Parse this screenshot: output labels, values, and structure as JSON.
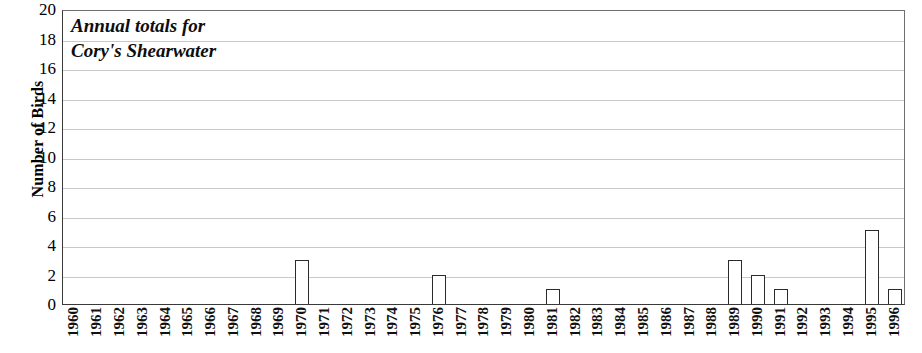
{
  "chart_data": {
    "type": "bar",
    "title": "Annual totals for Cory's Shearwater",
    "title_lines": [
      "Annual totals for",
      "Cory's Shearwater"
    ],
    "xlabel": "",
    "ylabel": "Number of Birds",
    "ylim": [
      0,
      20
    ],
    "ytick_step": 2,
    "yticks": [
      20,
      18,
      16,
      14,
      12,
      10,
      8,
      6,
      4,
      2,
      0
    ],
    "grid": true,
    "grid_axis": "y",
    "legend": null,
    "bar_color": "#ffffff",
    "bar_edge_color": "#2b2b2b",
    "grid_color": "#c9c9c9",
    "axis_color": "#3a3a3a",
    "categories": [
      "1960",
      "1961",
      "1962",
      "1963",
      "1964",
      "1965",
      "1966",
      "1967",
      "1968",
      "1969",
      "1970",
      "1971",
      "1972",
      "1973",
      "1974",
      "1975",
      "1976",
      "1977",
      "1978",
      "1979",
      "1980",
      "1981",
      "1982",
      "1983",
      "1984",
      "1985",
      "1986",
      "1987",
      "1988",
      "1989",
      "1990",
      "1991",
      "1992",
      "1993",
      "1994",
      "1995",
      "1996"
    ],
    "values": [
      0,
      0,
      0,
      0,
      0,
      0,
      0,
      0,
      0,
      0,
      3,
      0,
      0,
      0,
      0,
      0,
      2,
      0,
      0,
      0,
      0,
      1,
      0,
      0,
      0,
      0,
      0,
      0,
      0,
      3,
      2,
      1,
      0,
      0,
      0,
      5,
      1
    ]
  }
}
